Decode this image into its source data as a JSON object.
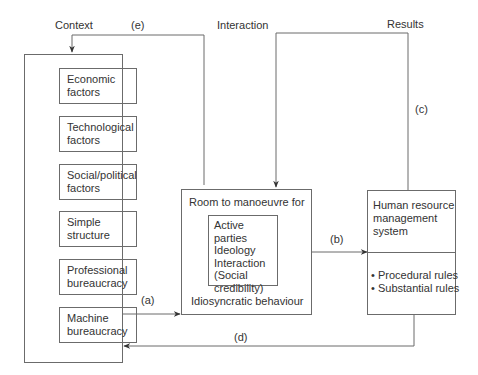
{
  "header_labels": {
    "context": "Context",
    "e": "(e)",
    "interaction": "Interaction",
    "results": "Results"
  },
  "context_box": {
    "items": [
      {
        "line1": "Economic",
        "line2": "factors"
      },
      {
        "line1": "Technological",
        "line2": "factors"
      },
      {
        "line1": "Social/political",
        "line2": "factors"
      },
      {
        "line1": "Simple",
        "line2": "structure"
      },
      {
        "line1": "Professional",
        "line2": "bureaucracy"
      },
      {
        "line1": "Machine",
        "line2": "bureaucracy"
      }
    ]
  },
  "center_box": {
    "title": "Room to manoeuvre for",
    "inner_lines": [
      "Active parties",
      "Ideology",
      "Interaction",
      "(Social",
      "credibility)"
    ],
    "footer": "Idiosyncratic behaviour"
  },
  "hrm_box": {
    "title_lines": [
      "Human resource",
      "management",
      "system"
    ],
    "bullets": [
      "Procedural rules",
      "Substantial rules"
    ]
  },
  "arrow_labels": {
    "a": "(a)",
    "b": "(b)",
    "c": "(c)",
    "d": "(d)"
  },
  "colors": {
    "line": "#6b6b6b",
    "arrowhead": "#333333",
    "text": "#333333"
  }
}
